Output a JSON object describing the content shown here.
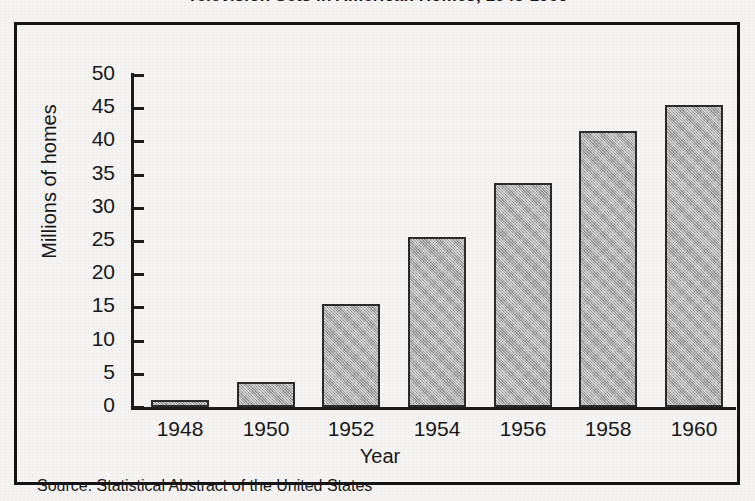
{
  "chart_data": {
    "type": "bar",
    "title": "Television Sets in American Homes, 1948-1960",
    "title_visible_fragment": ", 1948-1960",
    "categories": [
      "1948",
      "1950",
      "1952",
      "1954",
      "1956",
      "1958",
      "1960"
    ],
    "values": [
      1.0,
      3.8,
      15.5,
      25.6,
      33.8,
      41.5,
      45.5
    ],
    "series": [
      {
        "name": "Millions of homes",
        "values": [
          1.0,
          3.8,
          15.5,
          25.6,
          33.8,
          41.5,
          45.5
        ]
      }
    ],
    "xlabel": "Year",
    "ylabel": "Millions of homes",
    "ylim": [
      0,
      50
    ],
    "ytick_values": [
      0,
      5,
      10,
      15,
      20,
      25,
      30,
      35,
      40,
      45,
      50
    ],
    "ytick_labels": [
      "0",
      "5",
      "10",
      "15",
      "20",
      "25",
      "30",
      "35",
      "40",
      "45",
      "50"
    ],
    "grid": false,
    "legend": "none",
    "bar_fill_color": "#aaaaaa",
    "bar_border_color": "#2b2b2b",
    "axis_color": "#1b1b1b",
    "background_color": "#f5f4f2",
    "frame_color": "#141414",
    "source": "Source: Statistical Abstract of the United States"
  },
  "figure": {
    "source_note": "Source: Statistical Abstract of the United States",
    "axis_titles": {
      "x": "Year",
      "y": "Millions of homes"
    }
  }
}
